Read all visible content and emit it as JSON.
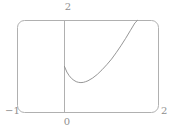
{
  "figure": {
    "name": "function-plot",
    "background": "#ffffff",
    "line_color": "#b0b0b0",
    "axis_color": "#b0b0b0",
    "curve_color": "#8a8a8a",
    "label_color": "#8f8f8f"
  },
  "labels": {
    "y_top": "2",
    "x_left": "−1",
    "origin": "0",
    "x_right": "2"
  },
  "chart_data": {
    "type": "line",
    "title": "",
    "xlabel": "",
    "ylabel": "",
    "xlim": [
      -1,
      2
    ],
    "ylim": [
      0,
      2
    ],
    "grid": false,
    "legend": null,
    "frame": "rounded-rectangle",
    "xticks": [
      -1,
      0,
      2
    ],
    "xticklabels": [
      "−1",
      "0",
      "2"
    ],
    "yticks": [
      2
    ],
    "yticklabels": [
      "2"
    ],
    "series": [
      {
        "name": "curve",
        "x": [
          0.0,
          0.05,
          0.1,
          0.15,
          0.2,
          0.25,
          0.3,
          0.35,
          0.4,
          0.45,
          0.5,
          0.6,
          0.7,
          0.8,
          0.9,
          1.0,
          1.1,
          1.2,
          1.3,
          1.4,
          1.5,
          1.55
        ],
        "y": [
          1.0,
          0.88,
          0.8,
          0.74,
          0.7,
          0.67,
          0.655,
          0.65,
          0.655,
          0.67,
          0.69,
          0.75,
          0.83,
          0.93,
          1.04,
          1.16,
          1.3,
          1.45,
          1.61,
          1.78,
          1.95,
          2.0
        ]
      }
    ]
  }
}
